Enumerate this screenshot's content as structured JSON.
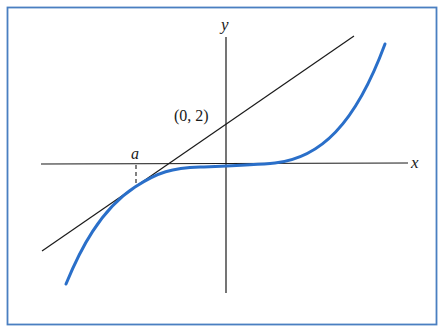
{
  "figure": {
    "border_color": "#4a7fc1",
    "curve_color": "#2a6fc9",
    "line_color": "#1a1a1a"
  },
  "axes": {
    "x_label": "x",
    "y_label": "y"
  },
  "annotations": {
    "point_label": "(0, 2)",
    "tangent_point_label": "a"
  },
  "elements": {
    "curve": "function curve y = f(x)",
    "tangent_line": "tangent line at x = a through (0, 2)",
    "dashed_marker": "dashed vertical segment from x-axis to curve at x = a"
  }
}
